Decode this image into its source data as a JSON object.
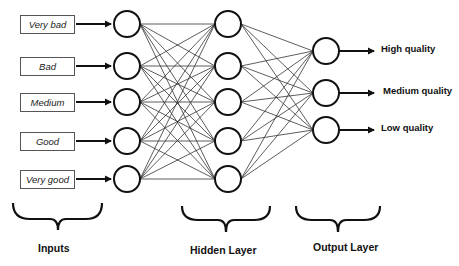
{
  "diagram": {
    "type": "neural-network",
    "inputs": [
      "Very bad",
      "Bad",
      "Medium",
      "Good",
      "Very good"
    ],
    "hidden_node_count": 5,
    "outputs": [
      "High quality",
      "Medium quality",
      "Low quality"
    ],
    "layer_labels": {
      "inputs": "Inputs",
      "hidden": "Hidden Layer",
      "output": "Output Layer"
    },
    "colors": {
      "stroke": "#111111",
      "edge": "#333333",
      "background": "#ffffff"
    }
  }
}
